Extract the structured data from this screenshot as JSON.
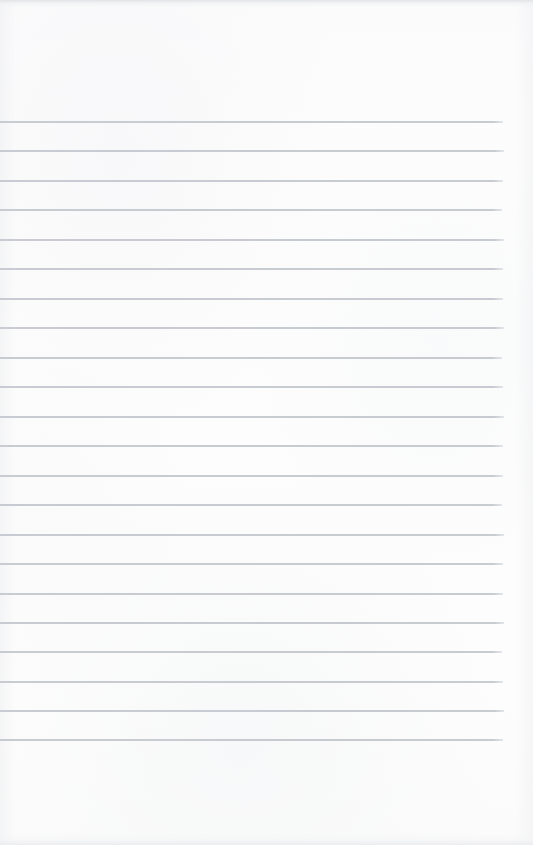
{
  "page": {
    "kind": "scanned-ruled-notepad-page",
    "width": 533,
    "height": 845,
    "background_color": "#fcfcfc",
    "text_content": "",
    "annotations": []
  },
  "ruling": {
    "line_color": "#c3c8ce",
    "line_thickness_px": 1.5,
    "line_count": 22,
    "first_line_y": 122,
    "last_line_y": 740,
    "line_spacing_px": 29.4,
    "line_start_x": 0,
    "line_end_x": 503,
    "top_margin_px": 122,
    "bottom_margin_px": 105,
    "right_margin_px": 30,
    "lines": [
      {
        "index": 1,
        "y": 122,
        "x1": 0,
        "x2": 503
      },
      {
        "index": 2,
        "y": 151,
        "x1": 0,
        "x2": 504
      },
      {
        "index": 3,
        "y": 181,
        "x1": 0,
        "x2": 503
      },
      {
        "index": 4,
        "y": 210,
        "x1": 0,
        "x2": 502
      },
      {
        "index": 5,
        "y": 240,
        "x1": 0,
        "x2": 504
      },
      {
        "index": 6,
        "y": 269,
        "x1": 0,
        "x2": 503
      },
      {
        "index": 7,
        "y": 299,
        "x1": 0,
        "x2": 503
      },
      {
        "index": 8,
        "y": 328,
        "x1": 0,
        "x2": 504
      },
      {
        "index": 9,
        "y": 358,
        "x1": 0,
        "x2": 502
      },
      {
        "index": 10,
        "y": 387,
        "x1": 0,
        "x2": 503
      },
      {
        "index": 11,
        "y": 417,
        "x1": 0,
        "x2": 504
      },
      {
        "index": 12,
        "y": 446,
        "x1": 0,
        "x2": 503
      },
      {
        "index": 13,
        "y": 476,
        "x1": 0,
        "x2": 503
      },
      {
        "index": 14,
        "y": 505,
        "x1": 0,
        "x2": 502
      },
      {
        "index": 15,
        "y": 535,
        "x1": 0,
        "x2": 504
      },
      {
        "index": 16,
        "y": 564,
        "x1": 0,
        "x2": 503
      },
      {
        "index": 17,
        "y": 594,
        "x1": 0,
        "x2": 503
      },
      {
        "index": 18,
        "y": 623,
        "x1": 0,
        "x2": 504
      },
      {
        "index": 19,
        "y": 652,
        "x1": 0,
        "x2": 502
      },
      {
        "index": 20,
        "y": 682,
        "x1": 0,
        "x2": 503
      },
      {
        "index": 21,
        "y": 711,
        "x1": 0,
        "x2": 504
      },
      {
        "index": 22,
        "y": 740,
        "x1": 0,
        "x2": 503
      }
    ]
  }
}
